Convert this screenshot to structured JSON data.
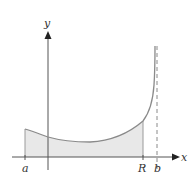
{
  "figure": {
    "axes": {
      "x_label": "x",
      "y_label": "y"
    },
    "tick_labels": {
      "a": "a",
      "R": "R",
      "b": "b"
    },
    "colors": {
      "curve": "#8a8a8a",
      "axes": "#555555",
      "fill": "#e8e8e8",
      "asymptote": "#8a8a8a"
    }
  }
}
